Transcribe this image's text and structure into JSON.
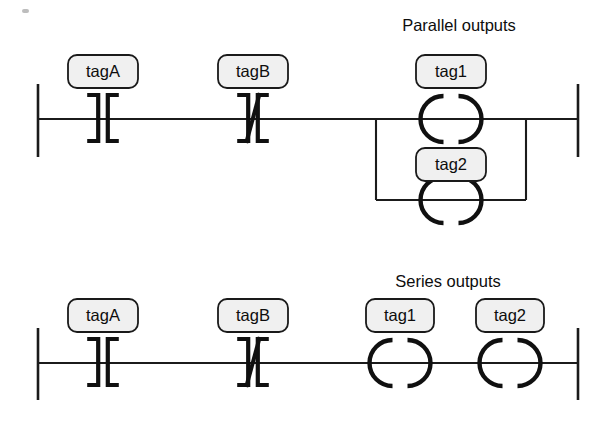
{
  "diagram": {
    "type": "ladder-logic",
    "background_color": "#ffffff",
    "line_color": "#1b1b1b",
    "tag_box_fill": "#f0f0f0",
    "tag_box_border": "#1a1a1a",
    "rungs": [
      {
        "id": "rung-parallel",
        "caption": "Parallel outputs",
        "caption_x": 459,
        "caption_y": 27,
        "rail_left_x": 38,
        "rail_right_x": 578,
        "rail_top_y": 84,
        "rail_bottom_y": 157,
        "rung_y": 119,
        "branch": {
          "left_x": 376,
          "right_x": 526,
          "lower_y": 200
        },
        "elements": [
          {
            "kind": "contact-no",
            "tag": "tagA",
            "center_x": 103,
            "box_x": 68,
            "box_y": 55,
            "box_w": 70,
            "box_h": 33
          },
          {
            "kind": "contact-nc",
            "tag": "tagB",
            "center_x": 253,
            "box_x": 218,
            "box_y": 55,
            "box_w": 70,
            "box_h": 33
          },
          {
            "kind": "coil",
            "tag": "tag1",
            "center_x": 451,
            "center_y": 119,
            "box_x": 416,
            "box_y": 55,
            "box_w": 70,
            "box_h": 33
          },
          {
            "kind": "coil",
            "tag": "tag2",
            "center_x": 451,
            "center_y": 200,
            "box_x": 416,
            "box_y": 148,
            "box_w": 70,
            "box_h": 33
          }
        ]
      },
      {
        "id": "rung-series",
        "caption": "Series outputs",
        "caption_x": 448,
        "caption_y": 283,
        "rail_left_x": 38,
        "rail_right_x": 578,
        "rail_top_y": 328,
        "rail_bottom_y": 400,
        "rung_y": 363,
        "elements": [
          {
            "kind": "contact-no",
            "tag": "tagA",
            "center_x": 103,
            "box_x": 68,
            "box_y": 299,
            "box_w": 70,
            "box_h": 33
          },
          {
            "kind": "contact-nc",
            "tag": "tagB",
            "center_x": 253,
            "box_x": 218,
            "box_y": 299,
            "box_w": 70,
            "box_h": 33
          },
          {
            "kind": "coil",
            "tag": "tag1",
            "center_x": 400,
            "center_y": 363,
            "box_x": 366,
            "box_y": 299,
            "box_w": 68,
            "box_h": 33
          },
          {
            "kind": "coil",
            "tag": "tag2",
            "center_x": 510,
            "center_y": 363,
            "box_x": 476,
            "box_y": 299,
            "box_w": 68,
            "box_h": 33
          }
        ]
      }
    ]
  }
}
